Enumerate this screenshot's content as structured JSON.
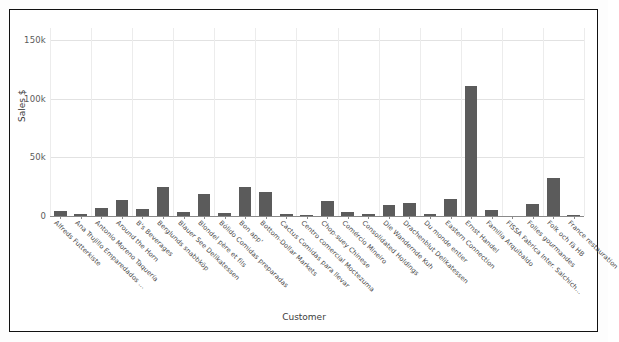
{
  "chart_data": {
    "type": "bar",
    "title": "",
    "xlabel": "Customer",
    "ylabel": "Sales $",
    "ylim": [
      0,
      160000
    ],
    "grid": true,
    "legend": "none",
    "yticks": [
      {
        "value": 0,
        "label": "0"
      },
      {
        "value": 50000,
        "label": "50k"
      },
      {
        "value": 100000,
        "label": "100k"
      },
      {
        "value": 150000,
        "label": "150k"
      }
    ],
    "categories": [
      "Alfreds Futterkiste",
      "Ana Trujillo Emparedados ...",
      "Antonio Moreno Taquería",
      "Around the Horn",
      "B's Beverages",
      "Berglunds snabbköp",
      "Blauer See Delikatessen",
      "Blondel père et fils",
      "Bólido Comidas preparadas",
      "Bon app'",
      "Bottom-Dollar Markets",
      "Cactus Comidas para llevar",
      "Centro comercial Moctezuma",
      "Chop-suey Chinese",
      "Comércio Mineiro",
      "Consolidated Holdings",
      "Die Wandernde Kuh",
      "Drachenblut Delikatessen",
      "Du monde entier",
      "Eastern Connection",
      "Ernst Handel",
      "Familia Arquibaldo",
      "FISSA Fabrica Inter. Salchich...",
      "Folies gourmandes",
      "Folk och fä HB",
      "France restauration"
    ],
    "values": [
      4273,
      1403,
      7023,
      13390,
      6089,
      24927,
      3239,
      18534,
      2302,
      24924,
      20801,
      1814,
      100,
      12682,
      3811,
      1719,
      9588,
      11493,
      1615,
      14761,
      110277,
      5400,
      0,
      10000,
      32000,
      1200
    ],
    "bar_color": "#5b5b5b"
  }
}
